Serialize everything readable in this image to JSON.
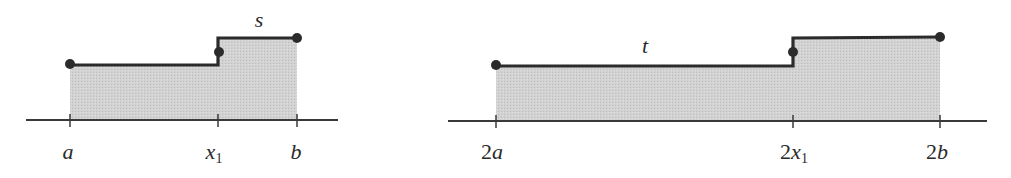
{
  "colors": {
    "fill": "#cdcdcd",
    "stroke": "#2b2b2b",
    "dot": "#2b2b2b",
    "axis": "#3a3a3a",
    "background": "#ffffff"
  },
  "diagrams": [
    {
      "name": "step-function-s",
      "function_label": "s",
      "ticks": [
        {
          "italic": "a",
          "prefix": "",
          "sub": ""
        },
        {
          "italic": "x",
          "prefix": "",
          "sub": "1"
        },
        {
          "italic": "b",
          "prefix": "",
          "sub": ""
        }
      ],
      "levels": {
        "low": "lower step on [a, x1)",
        "high": "upper step on [x1, b]"
      }
    },
    {
      "name": "step-function-t",
      "function_label": "t",
      "ticks": [
        {
          "italic": "a",
          "prefix": "2",
          "sub": ""
        },
        {
          "italic": "x",
          "prefix": "2",
          "sub": "1"
        },
        {
          "italic": "b",
          "prefix": "2",
          "sub": ""
        }
      ],
      "levels": {
        "low": "lower step on [2a, 2x1)",
        "high": "upper step on [2x1, 2b]"
      }
    }
  ]
}
